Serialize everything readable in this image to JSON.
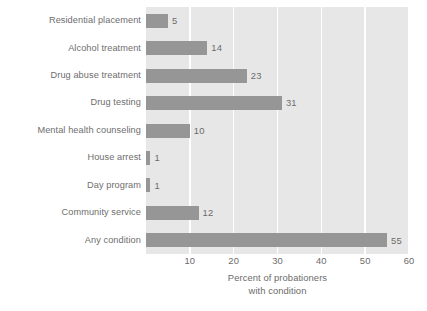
{
  "chart_data": {
    "type": "bar",
    "orientation": "horizontal",
    "title": "",
    "xlabel_line1": "Percent of probationers",
    "xlabel_line2": "with condition",
    "ylabel": "",
    "categories": [
      "Residential placement",
      "Alcohol treatment",
      "Drug abuse treatment",
      "Drug testing",
      "Mental health counseling",
      "House arrest",
      "Day program",
      "Community service",
      "Any condition"
    ],
    "values": [
      5,
      14,
      23,
      31,
      10,
      1,
      1,
      12,
      55
    ],
    "value_labels": [
      "5",
      "14",
      "23",
      "31",
      "10",
      "1",
      "1",
      "12",
      "55"
    ],
    "xlim": [
      0,
      60
    ],
    "xticks": [
      10,
      20,
      30,
      40,
      50,
      60
    ],
    "xtick_labels": [
      "10",
      "20",
      "30",
      "40",
      "50",
      "60"
    ],
    "grid": "vertical-white",
    "legend": "none",
    "colors": {
      "bar": "#969696",
      "plot_background": "#e7e7e7",
      "gridline": "#ffffff",
      "text": "#6b6b6b",
      "page_background": "#ffffff"
    }
  }
}
